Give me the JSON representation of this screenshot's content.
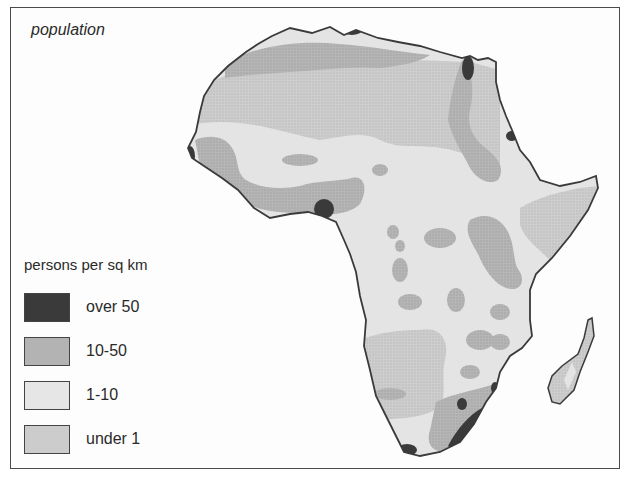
{
  "map": {
    "title": "population",
    "region": "Africa",
    "legend": {
      "title": "persons per sq km",
      "items": [
        {
          "label": "over 50",
          "color": "#3a3a3a"
        },
        {
          "label": "10-50",
          "color": "#b3b3b3"
        },
        {
          "label": "1-10",
          "color": "#e6e6e6"
        },
        {
          "label": "under 1",
          "color": "#cccccc"
        }
      ]
    }
  }
}
